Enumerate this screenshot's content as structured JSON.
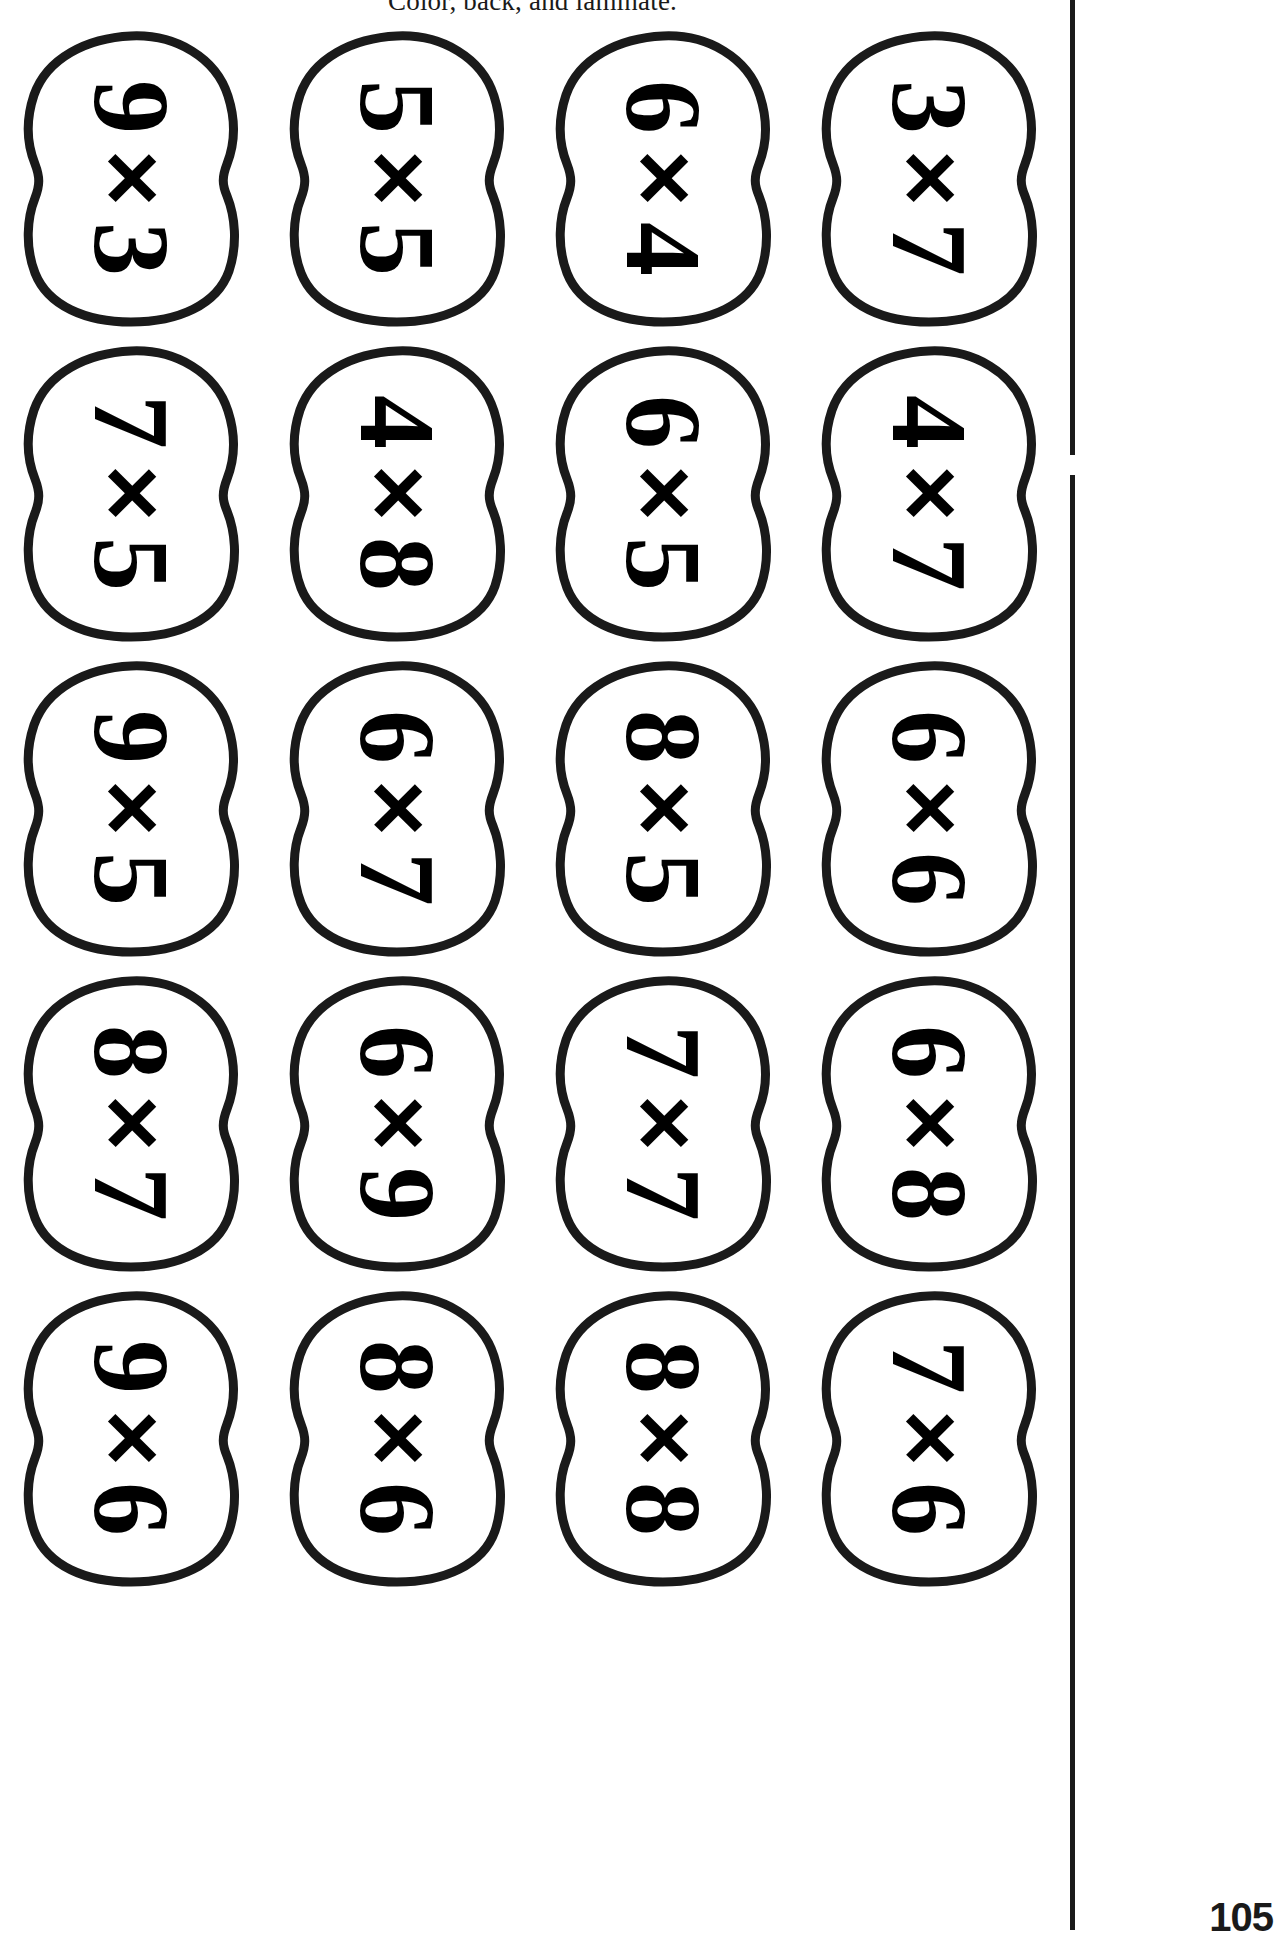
{
  "document": {
    "header_text": "Color, back, and laminate.",
    "page_number": "105",
    "ink_color": "#1a1a1a",
    "paper_color": "#ffffff",
    "operator_symbol": "×"
  },
  "cards": [
    {
      "a": "9",
      "op": "×",
      "b": "3"
    },
    {
      "a": "5",
      "op": "×",
      "b": "5"
    },
    {
      "a": "6",
      "op": "×",
      "b": "4"
    },
    {
      "a": "3",
      "op": "×",
      "b": "7"
    },
    {
      "a": "7",
      "op": "×",
      "b": "5"
    },
    {
      "a": "4",
      "op": "×",
      "b": "8"
    },
    {
      "a": "6",
      "op": "×",
      "b": "5"
    },
    {
      "a": "4",
      "op": "×",
      "b": "7"
    },
    {
      "a": "9",
      "op": "×",
      "b": "5"
    },
    {
      "a": "6",
      "op": "×",
      "b": "7"
    },
    {
      "a": "8",
      "op": "×",
      "b": "5"
    },
    {
      "a": "6",
      "op": "×",
      "b": "6"
    },
    {
      "a": "8",
      "op": "×",
      "b": "7"
    },
    {
      "a": "6",
      "op": "×",
      "b": "9"
    },
    {
      "a": "7",
      "op": "×",
      "b": "7"
    },
    {
      "a": "6",
      "op": "×",
      "b": "8"
    },
    {
      "a": "9",
      "op": "×",
      "b": "6"
    },
    {
      "a": "8",
      "op": "×",
      "b": "6"
    },
    {
      "a": "8",
      "op": "×",
      "b": "8"
    },
    {
      "a": "7",
      "op": "×",
      "b": "6"
    }
  ]
}
